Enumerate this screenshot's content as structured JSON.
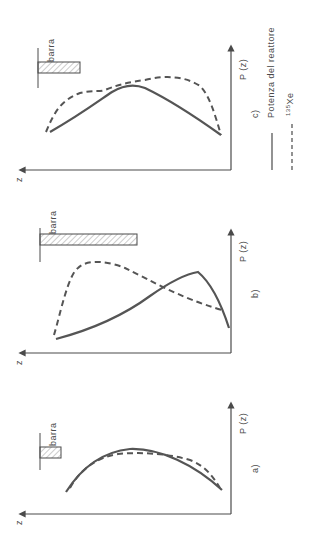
{
  "figure": {
    "orientation": "rotated-90-ccw",
    "colors": {
      "ink": "#4a4a4a",
      "hatch": "#9a9a9a",
      "background": "#ffffff"
    },
    "panels": [
      {
        "id": "a",
        "label": "a)",
        "x_axis_label": "z",
        "y_axis_label": "P (z)",
        "bar_label": "barra",
        "bar_insertion": "short",
        "description": "Power and 135Xe distributions nearly coincide, symmetric cosine-like profile"
      },
      {
        "id": "b",
        "label": "b)",
        "x_axis_label": "z",
        "y_axis_label": "P (z)",
        "bar_label": "barra",
        "bar_insertion": "long",
        "description": "Power peak shifted toward bottom, 135Xe peak shifted toward top"
      },
      {
        "id": "c",
        "label": "c)",
        "x_axis_label": "z",
        "y_axis_label": "P (z)",
        "bar_label": "barra",
        "bar_insertion": "medium",
        "description": "Power symmetric, 135Xe shows two humps"
      }
    ],
    "legend": [
      {
        "style": "solid",
        "label": "Potenza del reattore"
      },
      {
        "style": "dashed",
        "label_sup": "135",
        "label": "Xe"
      }
    ]
  }
}
